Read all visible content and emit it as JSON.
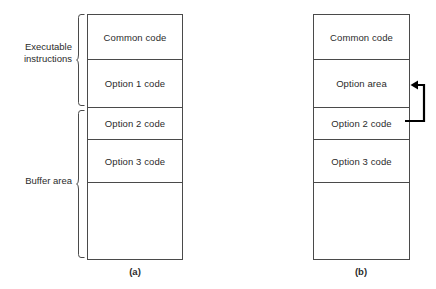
{
  "figure": {
    "stroke_color": "#4a4a4a",
    "text_color": "#2b2b2b",
    "background_color": "#ffffff"
  },
  "diagram_a": {
    "caption": "(a)",
    "rows": [
      {
        "label": "Common code"
      },
      {
        "label": "Option 1 code"
      },
      {
        "label": "Option 2 code"
      },
      {
        "label": "Option 3 code"
      },
      {
        "label": ""
      }
    ],
    "braces": [
      {
        "label": "Executable\ninstructions",
        "spans_rows": "0-1"
      },
      {
        "label": "Buffer area",
        "spans_rows": "2-4"
      }
    ]
  },
  "diagram_b": {
    "caption": "(b)",
    "rows": [
      {
        "label": "Common code"
      },
      {
        "label": "Option area"
      },
      {
        "label": "Option 2 code"
      },
      {
        "label": "Option 3 code"
      },
      {
        "label": ""
      }
    ],
    "arrow": {
      "name": "overlay-load-arrow",
      "from_row": "Option 2 code",
      "to_row": "Option area",
      "direction": "left"
    }
  }
}
